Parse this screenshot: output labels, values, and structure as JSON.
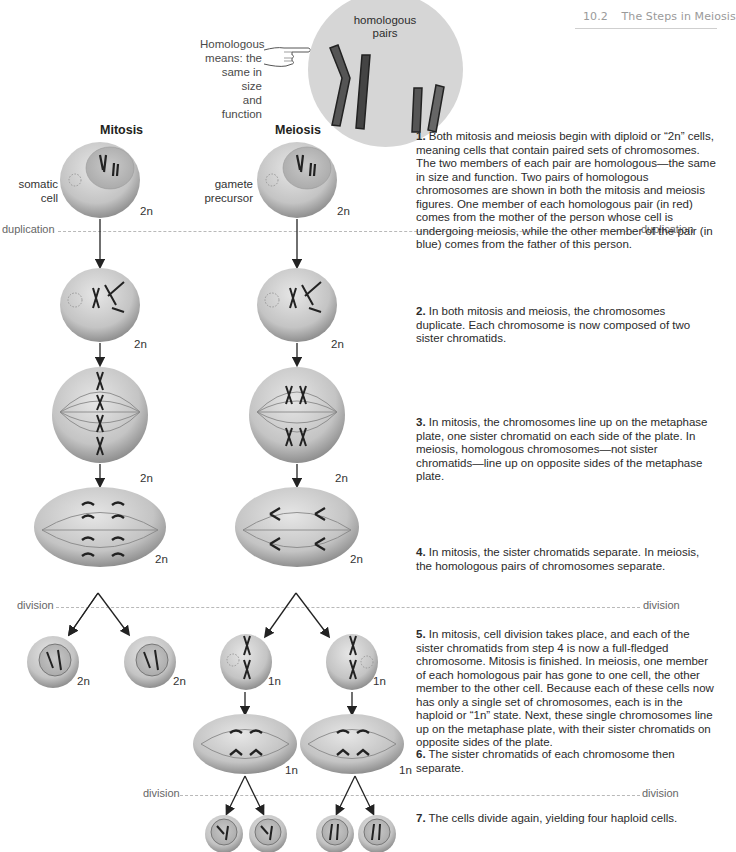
{
  "header": {
    "section_number": "10.2",
    "section_title": "The Steps in Meiosis"
  },
  "callout": {
    "text": "Homologous means: the same in size and function",
    "lines": [
      "Homologous",
      "means: the",
      "same in size",
      "and function"
    ],
    "icon": "pointing-hand-icon"
  },
  "inset": {
    "label_lines": [
      "homologous",
      "pairs"
    ]
  },
  "columns": {
    "mitosis": "Mitosis",
    "meiosis": "Meiosis"
  },
  "cell_labels": {
    "somatic": [
      "somatic",
      "cell"
    ],
    "gamete": [
      "gamete",
      "precursor"
    ]
  },
  "ploidy": {
    "diploid": "2n",
    "haploid": "1n"
  },
  "phase_lines": {
    "duplication": "duplication",
    "division": "division"
  },
  "steps": [
    {
      "num": "1.",
      "text": "Both mitosis and meiosis begin with diploid or “2n” cells, meaning cells that contain paired sets of chromosomes. The two members of each pair are homologous—the same in size and function. Two pairs of homologous chromosomes are shown in both the mitosis and meiosis figures. One member of each homologous pair (in red) comes from the mother of the person whose cell is undergoing meiosis, while the other member of the pair (in blue) comes from the father of this person."
    },
    {
      "num": "2.",
      "text": "In both mitosis and meiosis, the chromosomes duplicate. Each chromosome is now composed of two sister chromatids."
    },
    {
      "num": "3.",
      "text": "In mitosis, the chromosomes line up on the metaphase plate, one sister chromatid on each side of the plate. In meiosis, homologous chromosomes—not sister chromatids—line up on opposite sides of the metaphase plate."
    },
    {
      "num": "4.",
      "text": "In mitosis, the sister chromatids separate. In meiosis, the homologous pairs of chromosomes separate."
    },
    {
      "num": "5.",
      "text": "In mitosis, cell division takes place, and each of the sister chromatids from step 4 is now a full-fledged chromosome. Mitosis is finished. In meiosis, one member of each homologous pair has gone to one cell, the other member to the other cell. Because each of these cells now has only a single set of chromosomes, each is in the haploid or “1n” state. Next, these single chromosomes line up on the metaphase plate, with their sister chromatids on opposite sides of the plate."
    },
    {
      "num": "6.",
      "text": "The sister chromatids of each chromosome then separate."
    },
    {
      "num": "7.",
      "text": "The cells divide again, yielding four haploid cells."
    }
  ]
}
